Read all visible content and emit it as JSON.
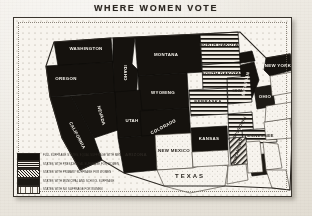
{
  "title": "WHERE WOMEN VOTE",
  "colors": {
    "paper": "#efece6",
    "ink": "#2b2722",
    "frame_border": "#3a352e",
    "map_paper": "#f6f3ed",
    "full_suffrage": "#15120e",
    "presidential": "#1a1712",
    "primary": "#1a1712",
    "municipal": "#1d1a15",
    "no_suffrage": "#f7f4ee"
  },
  "legend": {
    "items": [
      {
        "swatch": "full",
        "label": "FULL SUFFRAGE STATES, EQUAL SUFFRAGE WITH MEN"
      },
      {
        "swatch": "pres",
        "label": "STATES WITH PRESIDENTIAL SUFFRAGE FOR WOMEN"
      },
      {
        "swatch": "prim",
        "label": "STATES WITH PRIMARY SUFFRAGE FOR WOMEN"
      },
      {
        "swatch": "muni",
        "label": "STATES WITH MUNICIPAL AND SCHOOL SUFFRAGE"
      },
      {
        "swatch": "none",
        "label": "STATES WITH NO SUFFRAGE FOR WOMEN"
      }
    ]
  },
  "map": {
    "states": [
      {
        "code": "WA",
        "label": "WASHINGTON",
        "category": "full",
        "lx": 72,
        "ly": 32
      },
      {
        "code": "OR",
        "label": "OREGON",
        "category": "full",
        "lx": 52,
        "ly": 60
      },
      {
        "code": "ID",
        "label": "IDAHO",
        "category": "full",
        "lx": 97,
        "ly": 62
      },
      {
        "code": "MT",
        "label": "MONTANA",
        "category": "full",
        "lx": 137,
        "ly": 38
      },
      {
        "code": "WY",
        "label": "WYOMING",
        "category": "full",
        "lx": 133,
        "ly": 77
      },
      {
        "code": "CA",
        "label": "CALIFORNIA",
        "category": "full",
        "lx": 48,
        "ly": 110
      },
      {
        "code": "NV",
        "label": "NEVADA",
        "category": "full",
        "lx": 74,
        "ly": 92
      },
      {
        "code": "UT",
        "label": "UTAH",
        "category": "full",
        "lx": 100,
        "ly": 100
      },
      {
        "code": "CO",
        "label": "COLORADO",
        "category": "full",
        "lx": 139,
        "ly": 103
      },
      {
        "code": "AZ",
        "label": "ARIZONA",
        "category": "full",
        "lx": 90,
        "ly": 131
      },
      {
        "code": "ND",
        "label": "NORTH DAKOTA",
        "category": "pres",
        "lx": 180,
        "ly": 38
      },
      {
        "code": "SD",
        "label": "SOUTH DAKOTA",
        "category": "pres",
        "lx": 180,
        "ly": 58
      },
      {
        "code": "NE",
        "label": "NEBRASKA",
        "category": "pres",
        "lx": 180,
        "ly": 78
      },
      {
        "code": "KS",
        "label": "KANSAS",
        "category": "full",
        "lx": 180,
        "ly": 100
      },
      {
        "code": "IA",
        "label": "IOWA",
        "category": "pres",
        "lx": 209,
        "ly": 73
      },
      {
        "code": "MO",
        "label": "MISSOURI",
        "category": "pres",
        "lx": 214,
        "ly": 100
      },
      {
        "code": "NM",
        "label": "NEW MEXICO",
        "category": "none",
        "lx": 130,
        "ly": 133
      },
      {
        "code": "TX",
        "label": "TEXAS",
        "category": "none",
        "lx": 172,
        "ly": 152
      },
      {
        "code": "AR",
        "label": "ARKANSAS",
        "category": "prim",
        "lx": 213,
        "ly": 126
      },
      {
        "code": "TN",
        "label": "TENNESSEE",
        "category": "pres",
        "lx": 243,
        "ly": 118
      },
      {
        "code": "MI",
        "label": "MICHIGAN",
        "category": "full",
        "lx": 231,
        "ly": 58
      },
      {
        "code": "OH",
        "label": "OHIO",
        "category": "muni",
        "lx": 249,
        "ly": 83
      },
      {
        "code": "NY",
        "label": "NEW YORK",
        "category": "full",
        "lx": 268,
        "ly": 52
      }
    ]
  }
}
